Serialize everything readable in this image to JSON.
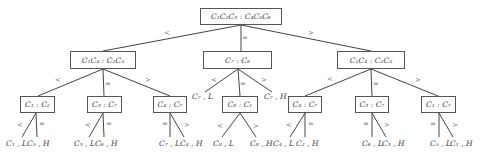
{
  "root": {
    "label": "C₁C₂C₃ : C₄C₅C₆"
  },
  "level2": [
    {
      "label": "C₁C₄ : C₂C₅"
    },
    {
      "label": "C₇ : C₈"
    },
    {
      "label": "C₁C₄ : C₂C₅"
    }
  ],
  "level3": [
    {
      "label": "C₁ : C₂"
    },
    {
      "label": "C₃ : C₇"
    },
    {
      "label": "C₄ : C₇"
    },
    {
      "label": "C₈ : C₁"
    },
    {
      "label": "C₄ : C₇"
    },
    {
      "label": "C₃ : C₇"
    },
    {
      "label": "C₁ : C₇"
    }
  ],
  "leaves": [
    "C₁ , L",
    "C₅ , H",
    "C₃ , L",
    "C₆ , H",
    "C₇ , L",
    "C₄ , H",
    "C₇ , L",
    "C₇ , H",
    "C₈ , L",
    "C₈ , H",
    "C₄ , L",
    "C₂ , H",
    "C₆ , L",
    "C₃ , H",
    "C₅ , L",
    "C₁ , H"
  ],
  "ops": {
    "lt": "<",
    "eq": "=",
    "gt": ">"
  }
}
